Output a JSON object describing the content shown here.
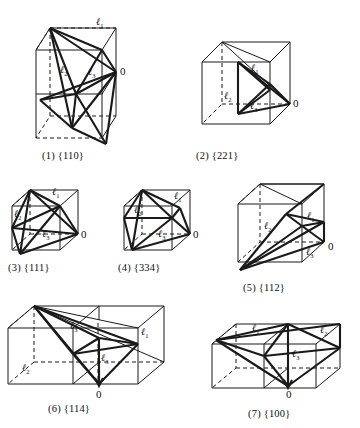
{
  "figure": {
    "origin_label": "0",
    "vector_labels": {
      "l1": "ℓ",
      "l1_sub": "1",
      "l2": "ℓ",
      "l2_sub": "2",
      "l3": "ℓ",
      "l3_sub": "3"
    },
    "stroke_color": "#1a1a1a",
    "background_color": "#ffffff"
  },
  "panels": [
    {
      "id": "panel-1",
      "number": "(1)",
      "miller": "{110}",
      "caption": "(1)  {110}",
      "cell_shape": "tetragonal-prism",
      "labels": [
        {
          "name": "l1",
          "text": "ℓ",
          "sub": "1"
        },
        {
          "name": "l2",
          "text": "ℓ",
          "sub": "2"
        },
        {
          "name": "l3",
          "text": "ℓ",
          "sub": "3"
        }
      ],
      "origin": "0"
    },
    {
      "id": "panel-2",
      "number": "(2)",
      "miller": "{221}",
      "caption": "(2)   {221}",
      "cell_shape": "cube",
      "labels": [
        {
          "name": "l1",
          "text": "ℓ",
          "sub": "1"
        },
        {
          "name": "l2",
          "text": "ℓ",
          "sub": "2"
        },
        {
          "name": "l3",
          "text": "ℓ",
          "sub": "3"
        }
      ],
      "origin": "0"
    },
    {
      "id": "panel-3",
      "number": "(3)",
      "miller": "{111}",
      "caption": "(3)  {111}",
      "cell_shape": "cube",
      "labels": [
        {
          "name": "l1",
          "text": "ℓ",
          "sub": "1"
        },
        {
          "name": "l2",
          "text": "ℓ",
          "sub": "2"
        },
        {
          "name": "l3",
          "text": "ℓ",
          "sub": "3"
        }
      ],
      "origin": "0"
    },
    {
      "id": "panel-4",
      "number": "(4)",
      "miller": "{334}",
      "caption": "(4)  {334}",
      "cell_shape": "cube",
      "labels": [
        {
          "name": "l1",
          "text": "ℓ",
          "sub": "1"
        },
        {
          "name": "l2",
          "text": "ℓ",
          "sub": "2"
        },
        {
          "name": "l3",
          "text": "ℓ",
          "sub": "3"
        }
      ],
      "origin": "0"
    },
    {
      "id": "panel-5",
      "number": "(5)",
      "miller": "{112}",
      "caption": "(5)   {112}",
      "cell_shape": "cube",
      "labels": [
        {
          "name": "l1",
          "text": "ℓ",
          "sub": "1"
        },
        {
          "name": "l2",
          "text": "ℓ",
          "sub": "2"
        },
        {
          "name": "l3",
          "text": "ℓ",
          "sub": "3"
        }
      ],
      "origin": "0"
    },
    {
      "id": "panel-6",
      "number": "(6)",
      "miller": "{114}",
      "caption": "(6)   {114}",
      "cell_shape": "rectangular-prism",
      "labels": [
        {
          "name": "l1",
          "text": "ℓ",
          "sub": "1"
        },
        {
          "name": "l2",
          "text": "ℓ",
          "sub": "2"
        },
        {
          "name": "l3",
          "text": "ℓ",
          "sub": "3"
        },
        {
          "name": "l3b",
          "text": "ℓ",
          "sub": "3"
        }
      ],
      "origin": "0"
    },
    {
      "id": "panel-7",
      "number": "(7)",
      "miller": "{100}",
      "caption": "(7)  {100}",
      "cell_shape": "rectangular-prism",
      "labels": [
        {
          "name": "l1",
          "text": "ℓ",
          "sub": "1"
        },
        {
          "name": "l2",
          "text": "ℓ",
          "sub": "2"
        },
        {
          "name": "l3",
          "text": "ℓ",
          "sub": "3"
        }
      ],
      "origin": "0"
    }
  ]
}
